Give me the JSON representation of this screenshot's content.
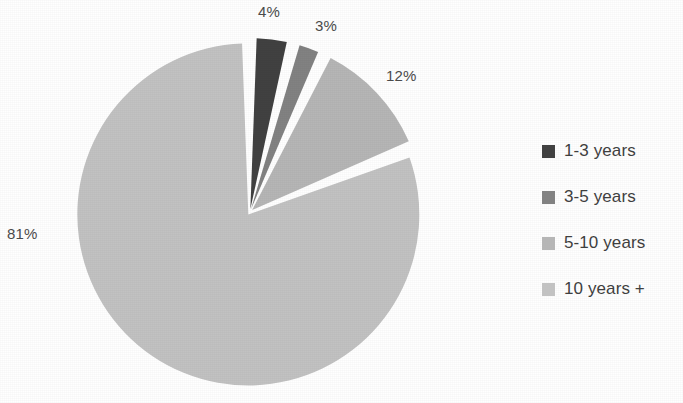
{
  "chart_data": {
    "type": "pie",
    "title": "",
    "subtitle": "",
    "xlabel": "",
    "ylabel": "",
    "legend_position": "right",
    "grid": false,
    "categories": [
      "1-3 years",
      "3-5 years",
      "5-10 years",
      "10 years +"
    ],
    "values": [
      4,
      3,
      12,
      81
    ],
    "value_unit": "%",
    "data_labels": [
      "4%",
      "3%",
      "12%",
      "81%"
    ],
    "colors": [
      "#414141",
      "#828282",
      "#b6b6b6",
      "#c2c2c2"
    ],
    "slice_separator_color": "#ffffff",
    "start_angle_deg": 0,
    "direction": "clockwise",
    "exploded": true,
    "background": "#ffffff"
  },
  "labels": {
    "p1": "4%",
    "p2": "3%",
    "p3": "12%",
    "p4": "81%"
  },
  "legend": {
    "items": [
      {
        "label": "1-3 years",
        "color": "#414141"
      },
      {
        "label": "3-5 years",
        "color": "#828282"
      },
      {
        "label": "5-10 years",
        "color": "#b6b6b6"
      },
      {
        "label": "10 years +",
        "color": "#c2c2c2"
      }
    ]
  }
}
